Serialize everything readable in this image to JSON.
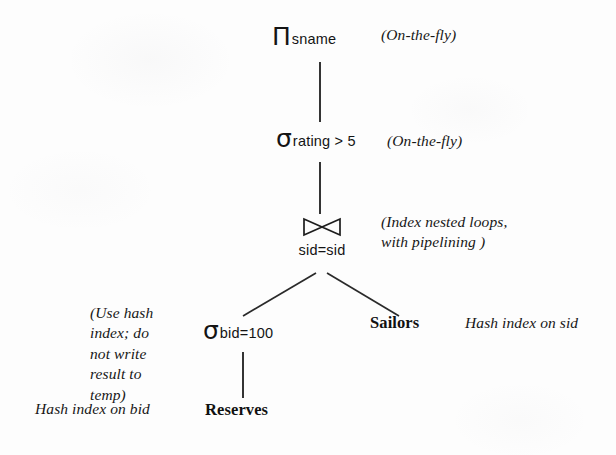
{
  "figure": {
    "kind": "query-evaluation-plan-tree",
    "background_color": "#fdfdfd",
    "ink_color": "#141414"
  },
  "nodes": {
    "projection": {
      "glyph": "Π",
      "glyph_name": "pi-projection-operator",
      "subscript": "sname"
    },
    "selection_rating": {
      "glyph": "σ",
      "glyph_name": "sigma-selection-operator",
      "subscript": "rating > 5"
    },
    "join": {
      "glyph": "⋈",
      "glyph_name": "bowtie-join-operator",
      "subscript": "sid=sid"
    },
    "selection_bid": {
      "glyph": "σ",
      "glyph_name": "sigma-selection-operator",
      "subscript": "bid=100"
    },
    "relation_reserves": {
      "label": "Reserves"
    },
    "relation_sailors": {
      "label": "Sailors"
    }
  },
  "annotations": {
    "projection_note": "(On-the-fly)",
    "selection_rating_note": "(On-the-fly)",
    "join_note": "(Index nested loops,\nwith pipelining )",
    "reserves_access_note": "(Use hash\nindex; do\nnot write\nresult to\ntemp)",
    "reserves_index_note": "Hash index on bid",
    "sailors_index_note": "Hash index on sid"
  }
}
